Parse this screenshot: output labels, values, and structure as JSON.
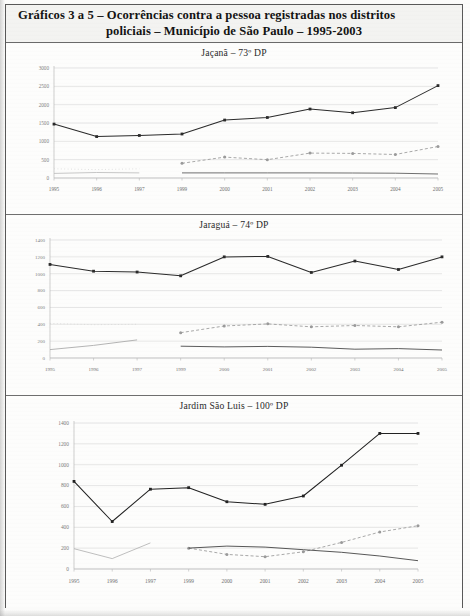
{
  "document": {
    "header": {
      "line1": "Gráficos 3 a 5 – Ocorrências contra a pessoa registradas nos distritos",
      "line2": "policiais – Município de São Paulo – 1995-2003"
    }
  },
  "chart_data": [
    {
      "type": "line",
      "title": "Jaçanã – 73º DP",
      "xlabel": "",
      "ylabel": "",
      "ylim": [
        0,
        3000
      ],
      "yticks": [
        0,
        500,
        1000,
        1500,
        2000,
        2500,
        3000
      ],
      "categories": [
        "1995",
        "1996",
        "1997",
        "1999",
        "2000",
        "2001",
        "2002",
        "2003",
        "2004",
        "2005"
      ],
      "grid": true,
      "legend": "none",
      "series": [
        {
          "name": "serie-principal",
          "color": "#2b2b2b",
          "style": "solid-marker",
          "values": [
            1470,
            1130,
            1160,
            1200,
            1580,
            1650,
            1880,
            1780,
            1920,
            2520
          ]
        },
        {
          "name": "serie-tracejada",
          "color": "#9a9a9a",
          "style": "dashed-marker",
          "values": [
            null,
            null,
            null,
            400,
            570,
            500,
            680,
            670,
            640,
            860
          ]
        },
        {
          "name": "serie-inferior-escura",
          "color": "#555555",
          "style": "solid",
          "values": [
            null,
            null,
            null,
            140,
            140,
            140,
            140,
            135,
            130,
            110
          ]
        },
        {
          "name": "serie-clara-inicial",
          "color": "#bcbcbc",
          "style": "solid",
          "values": [
            125,
            150,
            140,
            null,
            null,
            null,
            null,
            null,
            null,
            null
          ]
        },
        {
          "name": "serie-clara-pontilhada",
          "color": "#cccccc",
          "style": "dotted",
          "values": [
            250,
            230,
            250,
            null,
            null,
            null,
            null,
            null,
            null,
            null
          ]
        }
      ]
    },
    {
      "type": "line",
      "title": "Jaraguá – 74º DP",
      "xlabel": "",
      "ylabel": "",
      "ylim": [
        0,
        1400
      ],
      "yticks": [
        0,
        200,
        400,
        600,
        800,
        1000,
        1200,
        1400
      ],
      "categories": [
        "1995",
        "1996",
        "1997",
        "1999",
        "2000",
        "2001",
        "2002",
        "2003",
        "2004",
        "2005"
      ],
      "grid": true,
      "legend": "none",
      "series": [
        {
          "name": "serie-principal",
          "color": "#2b2b2b",
          "style": "solid-marker",
          "values": [
            1110,
            1030,
            1020,
            975,
            1200,
            1205,
            1015,
            1150,
            1050,
            1200
          ]
        },
        {
          "name": "serie-tracejada",
          "color": "#9a9a9a",
          "style": "dashed-marker",
          "values": [
            null,
            null,
            null,
            300,
            380,
            405,
            370,
            385,
            370,
            425
          ]
        },
        {
          "name": "serie-inferior-escura",
          "color": "#3f3f3f",
          "style": "solid",
          "values": [
            null,
            null,
            null,
            140,
            132,
            138,
            128,
            105,
            112,
            95
          ]
        },
        {
          "name": "serie-clara-inicial",
          "color": "#a8a8a8",
          "style": "solid",
          "values": [
            100,
            150,
            215,
            null,
            null,
            null,
            null,
            null,
            null,
            null
          ]
        },
        {
          "name": "serie-clara-pontilhada",
          "color": "#d2d2d2",
          "style": "dotted",
          "values": [
            410,
            395,
            400,
            null,
            null,
            null,
            null,
            null,
            null,
            null
          ]
        }
      ]
    },
    {
      "type": "line",
      "title": "Jardim São Luis – 100º DP",
      "xlabel": "",
      "ylabel": "",
      "ylim": [
        0,
        1400
      ],
      "yticks": [
        0,
        200,
        400,
        600,
        800,
        1000,
        1200,
        1400
      ],
      "categories": [
        "1995",
        "1996",
        "1997",
        "1999",
        "2000",
        "2001",
        "2002",
        "2003",
        "2004",
        "2005"
      ],
      "grid": true,
      "legend": "none",
      "series": [
        {
          "name": "serie-principal",
          "color": "#222222",
          "style": "solid-marker",
          "values": [
            840,
            455,
            765,
            780,
            645,
            620,
            700,
            995,
            1300,
            1300
          ]
        },
        {
          "name": "serie-tracejada",
          "color": "#9a9a9a",
          "style": "dashed-marker",
          "values": [
            null,
            null,
            null,
            200,
            140,
            118,
            165,
            255,
            355,
            415
          ]
        },
        {
          "name": "serie-inferior-escura",
          "color": "#3a3a3a",
          "style": "solid",
          "values": [
            null,
            null,
            null,
            200,
            220,
            210,
            185,
            160,
            125,
            80
          ]
        },
        {
          "name": "serie-clara-inicial",
          "color": "#b4b4b4",
          "style": "solid",
          "values": [
            195,
            100,
            250,
            null,
            null,
            null,
            null,
            null,
            null,
            null
          ]
        }
      ]
    }
  ]
}
